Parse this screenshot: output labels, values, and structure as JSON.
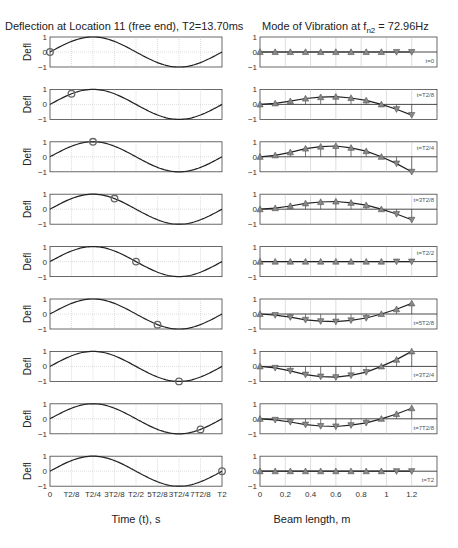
{
  "left": {
    "title": "Deflection at Location 11 (free end), T2=13.70ms",
    "ylabel": "Defl",
    "xlabel": "Time (t), s",
    "xticks": [
      "0",
      "T2/8",
      "T2/4",
      "3T2/8",
      "T2/2",
      "5T2/8",
      "3T2/4",
      "7T2/8",
      "T2"
    ],
    "yticks": [
      "1",
      "0",
      "−1"
    ]
  },
  "right": {
    "title_prefix": "Mode of Vibration at f",
    "title_sub": "n2",
    "title_suffix": " = 72.96Hz",
    "xlabel": "Beam length, m",
    "xticks": [
      "0",
      "0.2",
      "0.4",
      "0.6",
      "0.8",
      "1",
      "1.2"
    ],
    "yticks": [
      "1",
      "0",
      "−1"
    ]
  },
  "colors": {
    "curve": "#222222",
    "marker": "#666666",
    "grid": "#bbbbbb",
    "axes": "#444444"
  },
  "chart_data": [
    {
      "type": "line",
      "title": "Deflection at Location 11 (free end), T2=13.70ms",
      "xlabel": "Time (t), s",
      "ylabel": "Defl",
      "xlim": [
        0,
        1
      ],
      "ylim": [
        -1,
        1
      ],
      "grid": true,
      "x_tick_labels": [
        "0",
        "T2/8",
        "T2/4",
        "3T2/8",
        "T2/2",
        "5T2/8",
        "3T2/4",
        "7T2/8",
        "T2"
      ],
      "series": [
        {
          "name": "deflection",
          "function": "sin(2*pi*t/T2)"
        }
      ],
      "panels": [
        {
          "label": "t=0",
          "marker_t": 0.0,
          "marker_y": 0.0
        },
        {
          "label": "t=T2/8",
          "marker_t": 0.125,
          "marker_y": 0.71
        },
        {
          "label": "t=T2/4",
          "marker_t": 0.25,
          "marker_y": 1.0
        },
        {
          "label": "t=3T2/8",
          "marker_t": 0.375,
          "marker_y": 0.71
        },
        {
          "label": "t=T2/2",
          "marker_t": 0.5,
          "marker_y": 0.0
        },
        {
          "label": "t=5T2/8",
          "marker_t": 0.625,
          "marker_y": -0.71
        },
        {
          "label": "t=3T2/4",
          "marker_t": 0.75,
          "marker_y": -1.0
        },
        {
          "label": "t=7T2/8",
          "marker_t": 0.875,
          "marker_y": -0.71
        },
        {
          "label": "t=T2",
          "marker_t": 1.0,
          "marker_y": 0.0
        }
      ]
    },
    {
      "type": "line",
      "title": "Mode of Vibration at f_n2 = 72.96Hz",
      "xlabel": "Beam length, m",
      "ylabel": "",
      "xlim": [
        0,
        1.4
      ],
      "ylim": [
        -1,
        1
      ],
      "grid": true,
      "x": [
        0,
        0.12,
        0.24,
        0.36,
        0.48,
        0.6,
        0.72,
        0.84,
        0.96,
        1.08,
        1.2
      ],
      "mode_shape": [
        0.0,
        0.1,
        0.3,
        0.55,
        0.68,
        0.72,
        0.6,
        0.38,
        0.0,
        -0.45,
        -1.0
      ],
      "panels": [
        {
          "label": "t=0",
          "scale": 0.0
        },
        {
          "label": "t=T2/8",
          "scale": 0.71
        },
        {
          "label": "t=T2/4",
          "scale": 1.0
        },
        {
          "label": "t=3T2/8",
          "scale": 0.71
        },
        {
          "label": "t=T2/2",
          "scale": 0.0
        },
        {
          "label": "t=5T2/8",
          "scale": -0.71
        },
        {
          "label": "t=3T2/4",
          "scale": -1.0
        },
        {
          "label": "t=7T2/8",
          "scale": -0.71
        },
        {
          "label": "t=T2",
          "scale": 0.0
        }
      ]
    }
  ]
}
